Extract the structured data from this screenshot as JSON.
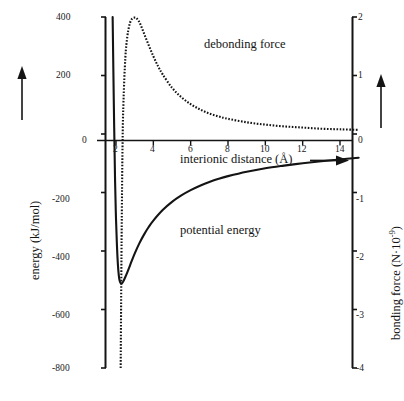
{
  "figure": {
    "background_color": "#ffffff",
    "ink_color": "#141414"
  },
  "axes": {
    "left": {
      "title": "energy (kJ/mol)",
      "title_arrow": "up-arrow",
      "ticks": [
        "400",
        "200",
        "0",
        "-200",
        "-400",
        "-600",
        "-800"
      ],
      "tick_values": [
        400,
        200,
        0,
        -200,
        -400,
        -600,
        -800
      ],
      "range": [
        -800,
        400
      ],
      "units": "kJ/mol"
    },
    "right": {
      "title_main": "bonding force (N·10",
      "title_exponent": "-9",
      "title_close": ")",
      "title_full": "bonding force (N·10-9)",
      "title_arrow": "up-arrow",
      "ticks": [
        "2",
        "1",
        "0",
        "-1",
        "-2",
        "-3",
        "-4"
      ],
      "tick_values": [
        2,
        1,
        0,
        -1,
        -2,
        -3,
        -4
      ],
      "range": [
        -4,
        2
      ],
      "units": "N·10^-9"
    },
    "bottom": {
      "title": "interionic distance (Å)",
      "title_arrow": "right-arrow",
      "ticks": [
        "2",
        "4",
        "6",
        "8",
        "10",
        "12",
        "14"
      ],
      "tick_values": [
        2,
        4,
        6,
        8,
        10,
        12,
        14
      ],
      "range": [
        1.45,
        15.0
      ],
      "units": "Å"
    }
  },
  "annotations": [
    {
      "name": "debonding-force-label",
      "text": "debonding force",
      "x_px": 204,
      "y_px": 45
    },
    {
      "name": "potential-energy-label",
      "text": "potential energy",
      "x_px": 180,
      "y_px": 231
    }
  ],
  "chart_data": {
    "type": "line",
    "title": "",
    "xlabel": "interionic distance (Å)",
    "ylabel": "energy (kJ/mol)",
    "y2label": "bonding force (N·10^-9)",
    "xlim": [
      1.45,
      15.0
    ],
    "ylim": [
      -800,
      400
    ],
    "y2lim": [
      -4,
      2
    ],
    "grid": false,
    "legend": "in-plot annotations",
    "series": [
      {
        "name": "potential energy",
        "axis": "left",
        "style": "solid",
        "color": "#141414",
        "x": [
          1.82,
          1.88,
          1.95,
          2.0,
          2.05,
          2.1,
          2.15,
          2.2,
          2.25,
          2.3,
          2.35,
          2.4,
          2.5,
          2.6,
          2.7,
          2.8,
          3.0,
          3.25,
          3.5,
          3.75,
          4.0,
          4.5,
          5.0,
          5.5,
          6.0,
          6.5,
          7.0,
          7.5,
          8.0,
          9.0,
          10.0,
          11.0,
          12.0,
          13.0,
          14.0,
          15.0
        ],
        "y": [
          400,
          120,
          -160,
          -290,
          -380,
          -445,
          -483,
          -503,
          -510,
          -511,
          -508,
          -503,
          -489,
          -474,
          -458,
          -441,
          -409,
          -374,
          -344,
          -318,
          -296,
          -260,
          -232,
          -210,
          -192,
          -177,
          -164,
          -153,
          -144,
          -129,
          -117,
          -108,
          -100,
          -93,
          -87,
          -81
        ]
      },
      {
        "name": "debonding force",
        "axis": "right",
        "style": "dotted",
        "color": "#141414",
        "x": [
          2.25,
          2.3,
          2.35,
          2.4,
          2.5,
          2.6,
          2.7,
          2.8,
          2.9,
          3.0,
          3.05,
          3.1,
          3.2,
          3.3,
          3.5,
          3.75,
          4.0,
          4.25,
          4.5,
          5.0,
          5.5,
          6.0,
          6.5,
          7.0,
          7.5,
          8.0,
          9.0,
          10.0,
          11.0,
          12.0,
          13.0,
          14.0,
          15.0
        ],
        "y_force": [
          -4.0,
          -1.8,
          -0.2,
          0.55,
          1.3,
          1.65,
          1.84,
          1.94,
          1.98,
          1.99,
          1.99,
          1.98,
          1.94,
          1.88,
          1.72,
          1.52,
          1.33,
          1.16,
          1.02,
          0.79,
          0.63,
          0.51,
          0.42,
          0.35,
          0.3,
          0.26,
          0.2,
          0.16,
          0.13,
          0.11,
          0.09,
          0.08,
          0.07
        ]
      }
    ],
    "features": {
      "equilibrium_distance_A": 2.3,
      "well_depth_kJ_per_mol": -511,
      "force_zero_crossing_A": 2.37,
      "force_peak_A": 3.0,
      "force_peak_value": 1.99
    }
  }
}
